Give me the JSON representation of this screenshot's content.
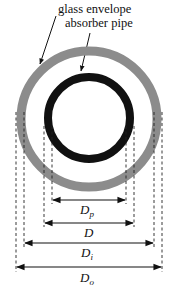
{
  "labels": {
    "glass_envelope": "glass envelope",
    "absorber_pipe": "absorber pipe"
  },
  "dimensions": [
    {
      "symbol": "D",
      "subscript": "p",
      "meaning": "absorber inner diameter"
    },
    {
      "symbol": "D",
      "subscript": "",
      "meaning": "absorber outer diameter"
    },
    {
      "symbol": "D",
      "subscript": "i",
      "meaning": "envelope inner diameter"
    },
    {
      "symbol": "D",
      "subscript": "o",
      "meaning": "envelope outer diameter"
    }
  ],
  "colors": {
    "glass": "#8c8c8c",
    "absorber": "#111111",
    "line": "#111111"
  }
}
